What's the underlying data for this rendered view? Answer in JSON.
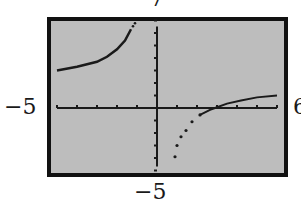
{
  "window_labels": {
    "ymax": "7",
    "xmin": "−5",
    "xmax": "6",
    "ymin": "−5"
  },
  "colors": {
    "screen": "#bdbdbd",
    "frame": "#111111",
    "curve": "#1a1a1a",
    "background": "#ffffff"
  },
  "chart_data": {
    "type": "line",
    "title": "",
    "xlabel": "",
    "ylabel": "",
    "xlim": [
      -5,
      6
    ],
    "ylim": [
      -5,
      7
    ],
    "grid": false,
    "xscale_ticks": 1,
    "yscale_ticks": 1,
    "tick_labels": {
      "left": "−5",
      "right": "6",
      "top": "7",
      "bottom": "−5"
    },
    "series": [
      {
        "name": "left-branch",
        "style": "connected",
        "x": [
          -5,
          -4,
          -3,
          -2.5,
          -2,
          -1.6,
          -1.3
        ],
        "y": [
          3.0,
          3.3,
          3.7,
          4.1,
          4.7,
          5.4,
          6.3
        ]
      },
      {
        "name": "right-branch",
        "style": "dotted-then-connected",
        "x": [
          0.9,
          1.0,
          1.2,
          1.45,
          1.75,
          2.15,
          2.65,
          2.9,
          3.5,
          4.2,
          5.0,
          6.0
        ],
        "y": [
          -3.9,
          -3.0,
          -2.3,
          -1.8,
          -1.1,
          -0.55,
          -0.15,
          0.0,
          0.35,
          0.6,
          0.85,
          1.0
        ]
      }
    ]
  }
}
